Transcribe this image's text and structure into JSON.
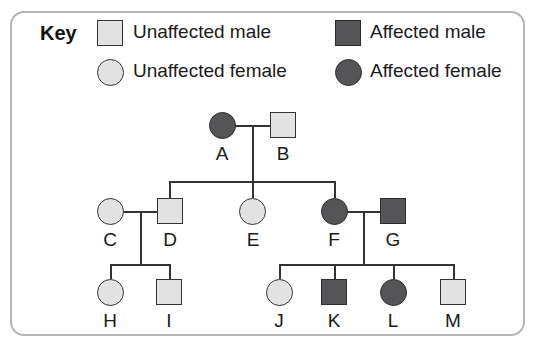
{
  "key": {
    "title": "Key",
    "entries": [
      {
        "label": "Unaffected male",
        "shape": "square",
        "affected": false
      },
      {
        "label": "Affected male",
        "shape": "square",
        "affected": true
      },
      {
        "label": "Unaffected female",
        "shape": "circle",
        "affected": false
      },
      {
        "label": "Affected female",
        "shape": "circle",
        "affected": true
      }
    ]
  },
  "colors": {
    "unaffected_fill": "#e2e2e2",
    "affected_fill": "#555557",
    "line": "#333333",
    "border": "#b5b5b5"
  },
  "pedigree": {
    "individuals": [
      {
        "id": "A",
        "sex": "female",
        "affected": true,
        "generation": 1
      },
      {
        "id": "B",
        "sex": "male",
        "affected": false,
        "generation": 1
      },
      {
        "id": "C",
        "sex": "female",
        "affected": false,
        "generation": 2
      },
      {
        "id": "D",
        "sex": "male",
        "affected": false,
        "generation": 2
      },
      {
        "id": "E",
        "sex": "female",
        "affected": false,
        "generation": 2
      },
      {
        "id": "F",
        "sex": "female",
        "affected": true,
        "generation": 2
      },
      {
        "id": "G",
        "sex": "male",
        "affected": true,
        "generation": 2
      },
      {
        "id": "H",
        "sex": "female",
        "affected": false,
        "generation": 3
      },
      {
        "id": "I",
        "sex": "male",
        "affected": false,
        "generation": 3
      },
      {
        "id": "J",
        "sex": "female",
        "affected": false,
        "generation": 3
      },
      {
        "id": "K",
        "sex": "male",
        "affected": true,
        "generation": 3
      },
      {
        "id": "L",
        "sex": "female",
        "affected": true,
        "generation": 3
      },
      {
        "id": "M",
        "sex": "male",
        "affected": false,
        "generation": 3
      }
    ],
    "couples": [
      {
        "partners": [
          "A",
          "B"
        ],
        "children": [
          "D",
          "E",
          "F"
        ]
      },
      {
        "partners": [
          "C",
          "D"
        ],
        "children": [
          "H",
          "I"
        ]
      },
      {
        "partners": [
          "F",
          "G"
        ],
        "children": [
          "J",
          "K",
          "L",
          "M"
        ]
      }
    ]
  }
}
